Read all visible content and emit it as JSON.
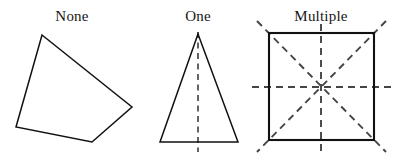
{
  "canvas": {
    "width": 404,
    "height": 160,
    "background": "#ffffff"
  },
  "style": {
    "outline_color": "#111111",
    "symmetry_line_color": "#3d3d3d",
    "label_color": "#161616",
    "label_font_size_px": 15
  },
  "figures": [
    {
      "id": "none",
      "label": "None",
      "label_x": 72,
      "label_y": 21,
      "shape": "irregular-quadrilateral",
      "symmetry_line_count": 0,
      "vertices": [
        [
          42,
          35
        ],
        [
          132,
          107
        ],
        [
          92,
          142
        ],
        [
          16,
          127
        ]
      ],
      "points_attr": "42,35 132,107 92,142 16,127",
      "symmetry_lines": []
    },
    {
      "id": "one",
      "label": "One",
      "label_x": 198,
      "label_y": 21,
      "shape": "isosceles-triangle",
      "symmetry_line_count": 1,
      "vertices": [
        [
          198,
          34
        ],
        [
          238,
          142
        ],
        [
          160,
          142
        ]
      ],
      "points_attr": "198,34 238,142 160,142",
      "symmetry_lines": [
        {
          "name": "vertical-axis",
          "x1": 198,
          "y1": 32,
          "x2": 198,
          "y2": 152
        }
      ]
    },
    {
      "id": "multiple",
      "label": "Multiple",
      "label_x": 321,
      "label_y": 21,
      "shape": "square",
      "symmetry_line_count": 4,
      "square": {
        "x": 269,
        "y": 33,
        "width": 105,
        "height": 107
      },
      "symmetry_lines": [
        {
          "name": "vertical-axis",
          "x1": 321,
          "y1": 24,
          "x2": 321,
          "y2": 151
        },
        {
          "name": "horizontal-axis",
          "x1": 252,
          "y1": 87,
          "x2": 392,
          "y2": 87
        },
        {
          "name": "diagonal-nwse",
          "x1": 257,
          "y1": 21,
          "x2": 386,
          "y2": 152
        },
        {
          "name": "diagonal-nesw",
          "x1": 386,
          "y1": 21,
          "x2": 257,
          "y2": 152
        }
      ]
    }
  ]
}
